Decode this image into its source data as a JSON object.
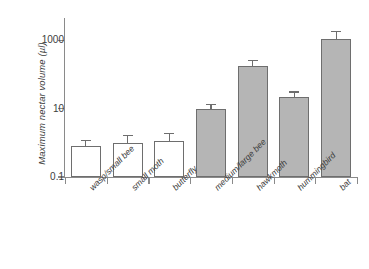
{
  "chart_data": {
    "type": "bar",
    "title": "",
    "xlabel": "",
    "ylabel": "Maximum nectar volume (µl)",
    "yscale": "log",
    "ylim": [
      0.1,
      3000
    ],
    "ytick_labels": [
      "1000",
      "10",
      "0.1"
    ],
    "ytick_values": [
      1000,
      10,
      0.1
    ],
    "grid": false,
    "legend": "none",
    "categories": [
      "wasp/small bee",
      "small moth",
      "butterfly",
      "medium/large bee",
      "hawkmoth",
      "hummingbird",
      "bat"
    ],
    "values": [
      0.8,
      1.0,
      1.1,
      10,
      180,
      22,
      1100
    ],
    "error_high": [
      1.2,
      1.7,
      2.0,
      14,
      270,
      32,
      1900
    ],
    "error_low": [
      0.8,
      1.0,
      1.1,
      10,
      180,
      22,
      1100
    ],
    "bar_fill": [
      "open",
      "open",
      "open",
      "filled",
      "filled",
      "filled",
      "filled"
    ],
    "series": [
      {
        "name": "Maximum nectar volume",
        "values": [
          0.8,
          1.0,
          1.1,
          10,
          180,
          22,
          1100
        ]
      }
    ],
    "colors": {
      "open_bar": "#ffffff",
      "filled_bar": "#b5b5b5",
      "outline": "#6e6e6e",
      "axis": "#8a8a8a",
      "text": "#3d3d3d"
    }
  }
}
